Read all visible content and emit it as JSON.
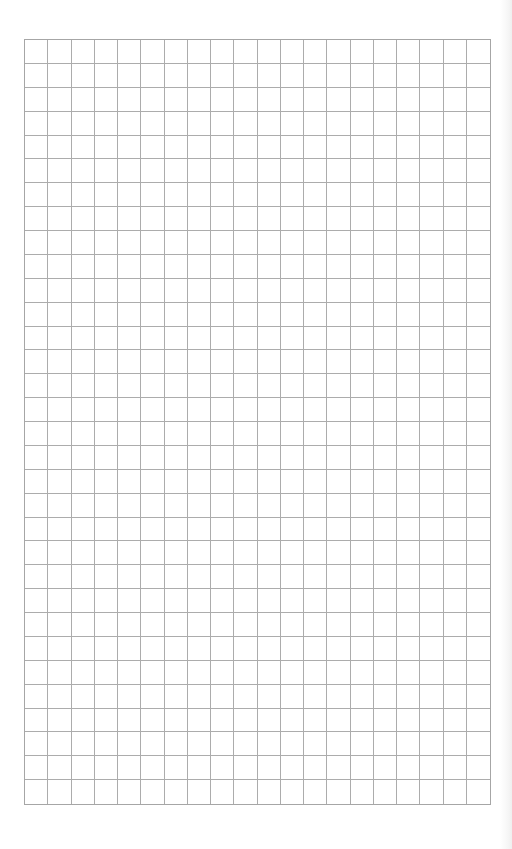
{
  "document": {
    "type": "graph-paper",
    "grid": {
      "columns": 20,
      "rows": 32,
      "line_color": "#a8a8a8",
      "background_color": "#ffffff"
    }
  }
}
